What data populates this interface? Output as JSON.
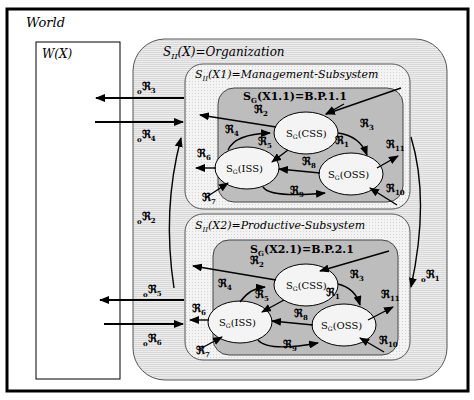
{
  "world": {
    "label": "World"
  },
  "environment": {
    "label": "W(X)"
  },
  "organization": {
    "label": "S",
    "sub": "II",
    "rest": "(X)=Organization"
  },
  "management": {
    "label": "S",
    "sub": "II",
    "rest": "(X1)=Management-Subsystem",
    "process": {
      "label": "S",
      "sub": "G",
      "rest": "(X1.1)=B.P.1.1"
    },
    "nodes": {
      "css": {
        "s": "S",
        "sub": "G",
        "rest": "(CSS)"
      },
      "iss": {
        "s": "S",
        "sub": "G",
        "rest": "(ISS)"
      },
      "oss": {
        "s": "S",
        "sub": "G",
        "rest": "(OSS)"
      }
    },
    "relations": {
      "r1": "ℜ",
      "r1_sub": "1",
      "r2": "ℜ",
      "r2_sub": "2",
      "r3": "ℜ",
      "r3_sub": "3",
      "r4": "ℜ",
      "r4_sub": "4",
      "r5": "ℜ",
      "r5_sub": "5",
      "r6": "ℜ",
      "r6_sub": "6",
      "r7": "ℜ",
      "r7_sub": "7",
      "r8": "ℜ",
      "r8_sub": "8",
      "r9": "ℜ",
      "r9_sub": "9",
      "r10": "ℜ",
      "r10_sub": "10",
      "r11": "ℜ",
      "r11_sub": "11"
    }
  },
  "productive": {
    "label": "S",
    "sub": "II",
    "rest": "(X2)=Productive-Subsystem",
    "process": {
      "label": "S",
      "sub": "G",
      "rest": "(X2.1)=B.P.2.1"
    },
    "nodes": {
      "css": {
        "s": "S",
        "sub": "G",
        "rest": "(CSS)"
      },
      "iss": {
        "s": "S",
        "sub": "G",
        "rest": "(ISS)"
      },
      "oss": {
        "s": "S",
        "sub": "G",
        "rest": "(OSS)"
      }
    },
    "relations": {
      "r1": "ℜ",
      "r1_sub": "1",
      "r2": "ℜ",
      "r2_sub": "2",
      "r3": "ℜ",
      "r3_sub": "3",
      "r4": "ℜ",
      "r4_sub": "4",
      "r5": "ℜ",
      "r5_sub": "5",
      "r6": "ℜ",
      "r6_sub": "6",
      "r7": "ℜ",
      "r7_sub": "7",
      "r8": "ℜ",
      "r8_sub": "8",
      "r9": "ℜ",
      "r9_sub": "9",
      "r10": "ℜ",
      "r10_sub": "10",
      "r11": "ℜ",
      "r11_sub": "11"
    }
  },
  "org_relations": {
    "o1": {
      "pre": "o",
      "sym": "ℜ",
      "sub": "1"
    },
    "o2": {
      "pre": "o",
      "sym": "ℜ",
      "sub": "2"
    },
    "o3": {
      "pre": "o",
      "sym": "ℜ",
      "sub": "3"
    },
    "o4": {
      "pre": "o",
      "sym": "ℜ",
      "sub": "4"
    },
    "o5": {
      "pre": "o",
      "sym": "ℜ",
      "sub": "5"
    },
    "o6": {
      "pre": "o",
      "sym": "ℜ",
      "sub": "6"
    }
  },
  "colors": {
    "org_fill": "#e6e6e6",
    "subsystem_fill": "#f0f0f0",
    "process_fill": "#bdbdbd",
    "node_fill": "#f4f4f4",
    "line": "#000000"
  }
}
